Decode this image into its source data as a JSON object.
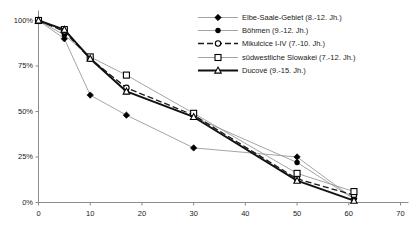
{
  "chart_data": {
    "type": "line",
    "title": "",
    "xlabel": "",
    "ylabel": "",
    "xlim": [
      0,
      70
    ],
    "ylim": [
      0,
      100
    ],
    "xticks": [
      0,
      10,
      20,
      30,
      40,
      50,
      60,
      70
    ],
    "yticks": [
      0,
      25,
      50,
      75,
      100
    ],
    "ytick_labels": [
      "0%",
      "25%",
      "50%",
      "75%",
      "100%"
    ],
    "xtick_labels": [
      "0",
      "10",
      "20",
      "30",
      "40",
      "50",
      "60",
      "70"
    ],
    "grid": false,
    "legend_position": "top-right",
    "series": [
      {
        "name": "Elbe-Saale-Gebiet (8.-12. Jh.)",
        "marker": "filled-diamond",
        "line_style": "solid",
        "x": [
          0,
          5,
          10,
          17,
          30,
          50,
          61
        ],
        "y": [
          100,
          90,
          59,
          48,
          30,
          25,
          2
        ]
      },
      {
        "name": "Böhmen (9.-12. Jh.)",
        "marker": "filled-circle",
        "line_style": "solid",
        "x": [
          0,
          5,
          10,
          17,
          30,
          50,
          61
        ],
        "y": [
          100,
          92,
          80,
          61,
          47,
          22,
          2
        ]
      },
      {
        "name": "Mikulcice I-IV (7.-10. Jh.)",
        "marker": "open-circle",
        "line_style": "dashed",
        "x": [
          0,
          5,
          10,
          17,
          30,
          50,
          61
        ],
        "y": [
          100,
          94,
          79,
          63,
          48,
          13,
          4
        ]
      },
      {
        "name": "südwestliche Slowakei (7.-12. Jh.)",
        "marker": "open-square",
        "line_style": "solid",
        "x": [
          0,
          5,
          10,
          17,
          30,
          50,
          61
        ],
        "y": [
          100,
          95,
          80,
          70,
          49,
          16,
          6
        ]
      },
      {
        "name": "Ducové (9.-15. Jh.)",
        "marker": "open-triangle",
        "line_style": "solid",
        "x": [
          0,
          5,
          10,
          17,
          30,
          50,
          61
        ],
        "y": [
          100,
          95,
          79,
          61,
          47,
          12,
          1
        ]
      }
    ]
  },
  "legend": {
    "items": [
      {
        "label": "Elbe-Saale-Gebiet (8.-12. Jh.)"
      },
      {
        "label": "Böhmen (9.-12. Jh.)"
      },
      {
        "label": "Mikulcice I-IV (7.-10. Jh.)"
      },
      {
        "label": "südwestliche Slowakei (7.-12. Jh.)"
      },
      {
        "label": "Ducové (9.-15. Jh.)"
      }
    ]
  },
  "colors": {
    "axis": "#8c8c8c",
    "ink": "#1a1a1a",
    "light_line": "#9a9a9a",
    "background": "#ffffff"
  }
}
